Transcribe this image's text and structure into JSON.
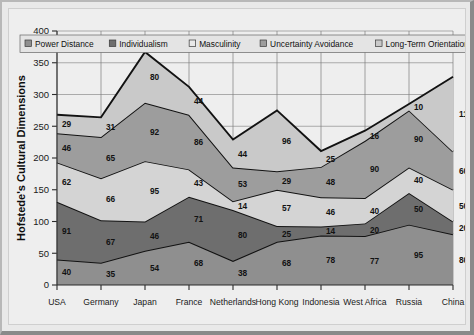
{
  "chart_data": {
    "type": "area",
    "stacked": true,
    "title": "",
    "xlabel": "",
    "ylabel": "Hofstede's Cultural Dimensions",
    "ylim": [
      0,
      400
    ],
    "ytick_step": 50,
    "yticks": [
      0,
      50,
      100,
      150,
      200,
      250,
      300,
      350,
      400
    ],
    "grid": true,
    "legend_position": "top-inside",
    "categories": [
      "USA",
      "Germany",
      "Japan",
      "France",
      "Netherlands",
      "Hong Kong",
      "Indonesia",
      "West Africa",
      "Russia",
      "China"
    ],
    "series": [
      {
        "name": "Power Distance",
        "color": "#8f8f8f",
        "values": [
          40,
          35,
          54,
          68,
          38,
          68,
          78,
          77,
          95,
          80
        ]
      },
      {
        "name": "Individualism",
        "color": "#6e6e6e",
        "values": [
          91,
          67,
          46,
          71,
          80,
          25,
          14,
          20,
          50,
          20
        ]
      },
      {
        "name": "Masculinity",
        "color": "#d4d4d4",
        "values": [
          62,
          66,
          95,
          43,
          14,
          57,
          46,
          40,
          40,
          50
        ]
      },
      {
        "name": "Uncertainty Avoidance",
        "color": "#9d9d9d",
        "values": [
          46,
          65,
          92,
          86,
          53,
          29,
          48,
          90,
          90,
          60
        ]
      },
      {
        "name": "Long-Term Orientation",
        "color": "#c9c9c9",
        "values": [
          29,
          31,
          80,
          44,
          44,
          96,
          25,
          16,
          10,
          118
        ]
      }
    ],
    "stack_totals": [
      268,
      264,
      367,
      312,
      229,
      275,
      211,
      243,
      285,
      328
    ]
  },
  "legend": {
    "items": [
      {
        "label": "Power Distance",
        "swatch": "#8f8f8f"
      },
      {
        "label": "Individualism",
        "swatch": "#6e6e6e"
      },
      {
        "label": "Masculinity",
        "swatch": "#e8e8e8"
      },
      {
        "label": "Uncertainty Avoidance",
        "swatch": "#9d9d9d"
      },
      {
        "label": "Long-Term Orientation",
        "swatch": "#c9c9c9"
      }
    ]
  },
  "colors": {
    "figure_background": "#e9e9e9",
    "plot_background": "#eeeeee",
    "axis": "#2b2b2b",
    "gridline": "#8d8d8d",
    "series_outline": "#121212"
  }
}
